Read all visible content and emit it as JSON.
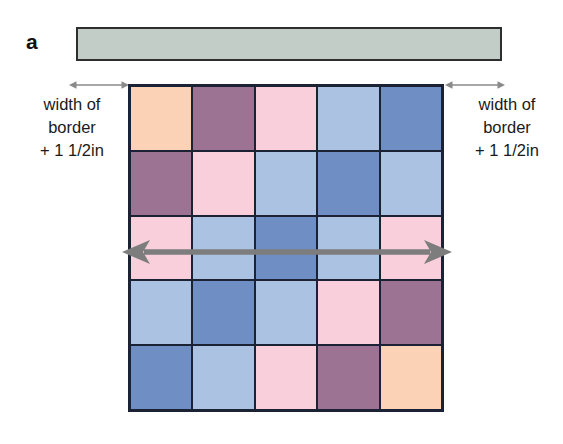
{
  "figure": {
    "panel_letter": "a",
    "background_color": "#ffffff"
  },
  "border_strip": {
    "name": "border-strip",
    "fill_color": "#c3cdc8",
    "outline_color": "#2e2e2e"
  },
  "captions": {
    "left": {
      "line1": "width of",
      "line2": "border",
      "line3": "+ 1 1/2in"
    },
    "right": {
      "line1": "width of",
      "line2": "border",
      "line3": "+ 1 1/2in"
    }
  },
  "arrows": {
    "color": "#7d7d7d",
    "measure_left_label": "measure-arrow-left",
    "measure_right_label": "measure-arrow-right",
    "span_label": "quilt-width-span-arrow"
  },
  "palette": {
    "peach": "#fbd2b5",
    "mauve": "#9d7394",
    "pink": "#f8cfda",
    "light_blue": "#acc2e2",
    "medium_blue": "#6f8ec4",
    "grid_line": "#1b2233"
  },
  "chart_data": {
    "type": "heatmap",
    "title": "",
    "xlabel": "",
    "ylabel": "",
    "rows": 5,
    "cols": 5,
    "categories": [
      "col1",
      "col2",
      "col3",
      "col4",
      "col5"
    ],
    "legend": [
      "peach",
      "mauve",
      "pink",
      "light_blue",
      "medium_blue"
    ],
    "grid": [
      [
        "peach",
        "mauve",
        "pink",
        "light_blue",
        "medium_blue"
      ],
      [
        "mauve",
        "pink",
        "light_blue",
        "medium_blue",
        "light_blue"
      ],
      [
        "pink",
        "light_blue",
        "medium_blue",
        "light_blue",
        "pink"
      ],
      [
        "light_blue",
        "medium_blue",
        "light_blue",
        "pink",
        "mauve"
      ],
      [
        "medium_blue",
        "light_blue",
        "pink",
        "mauve",
        "peach"
      ]
    ]
  }
}
